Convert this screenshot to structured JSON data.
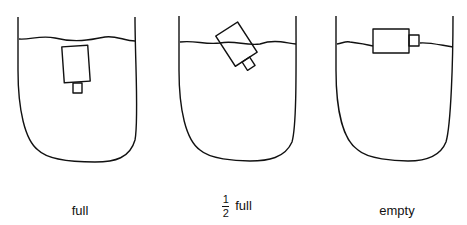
{
  "figure": {
    "panels": [
      {
        "id": "full",
        "label": "full",
        "state": "object submerged vertically, small tab pointing down"
      },
      {
        "id": "half",
        "label_numerator": "1",
        "label_denominator": "2",
        "label_text": "full",
        "state": "object tilted, partly above water line"
      },
      {
        "id": "empty",
        "label": "empty",
        "state": "object floating horizontally on water surface"
      }
    ],
    "colors": {
      "stroke": "#111111",
      "background": "#ffffff"
    }
  }
}
